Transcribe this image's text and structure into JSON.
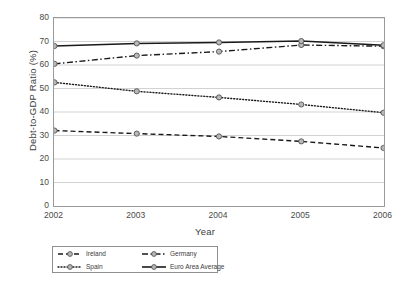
{
  "chart_data": {
    "type": "line",
    "title": "",
    "xlabel": "Year",
    "ylabel": "Debt-to-GDP Ratio (%)",
    "x": [
      2002,
      2003,
      2004,
      2005,
      2006
    ],
    "categories": [
      "2002",
      "2003",
      "2004",
      "2005",
      "2006"
    ],
    "xlim": [
      2002,
      2006
    ],
    "ylim": [
      0,
      80
    ],
    "yticks": [
      0,
      10,
      20,
      30,
      40,
      50,
      60,
      70,
      80
    ],
    "xticks": [
      "2002",
      "2003",
      "2004",
      "2005",
      "2006"
    ],
    "grid": "horizontal",
    "legend_position": "bottom-left",
    "series": [
      {
        "name": "Ireland",
        "values": [
          32.1,
          30.8,
          29.6,
          27.5,
          24.7
        ],
        "style": "dashed",
        "color": "#1a1a1a",
        "marker": "circle"
      },
      {
        "name": "Germany",
        "values": [
          60.5,
          64.0,
          65.7,
          68.5,
          68.0
        ],
        "style": "dash-dot",
        "color": "#1a1a1a",
        "marker": "circle"
      },
      {
        "name": "Spain",
        "values": [
          52.6,
          48.8,
          46.2,
          43.2,
          39.7
        ],
        "style": "dotted",
        "color": "#1a1a1a",
        "marker": "circle"
      },
      {
        "name": "Euro Area Average",
        "values": [
          68.1,
          69.2,
          69.6,
          70.2,
          68.4
        ],
        "style": "solid",
        "color": "#1a1a1a",
        "marker": "circle"
      }
    ]
  },
  "legend": {
    "items": [
      {
        "label": "Ireland",
        "style": "dashed"
      },
      {
        "label": "Germany",
        "style": "dash-dot"
      },
      {
        "label": "Spain",
        "style": "dotted"
      },
      {
        "label": "Euro Area Average",
        "style": "solid"
      }
    ]
  },
  "axes": {
    "y_title": "Debt-to-GDP Ratio (%)",
    "x_title": "Year",
    "y_ticks": [
      "0",
      "10",
      "20",
      "30",
      "40",
      "50",
      "60",
      "70",
      "80"
    ],
    "x_ticks": [
      "2002",
      "2003",
      "2004",
      "2005",
      "2006"
    ]
  },
  "colors": {
    "line": "#1a1a1a",
    "grid": "#d2d2d2",
    "frame": "#9a9a9a",
    "marker_fill": "#b8b8b8",
    "text": "#404040"
  }
}
